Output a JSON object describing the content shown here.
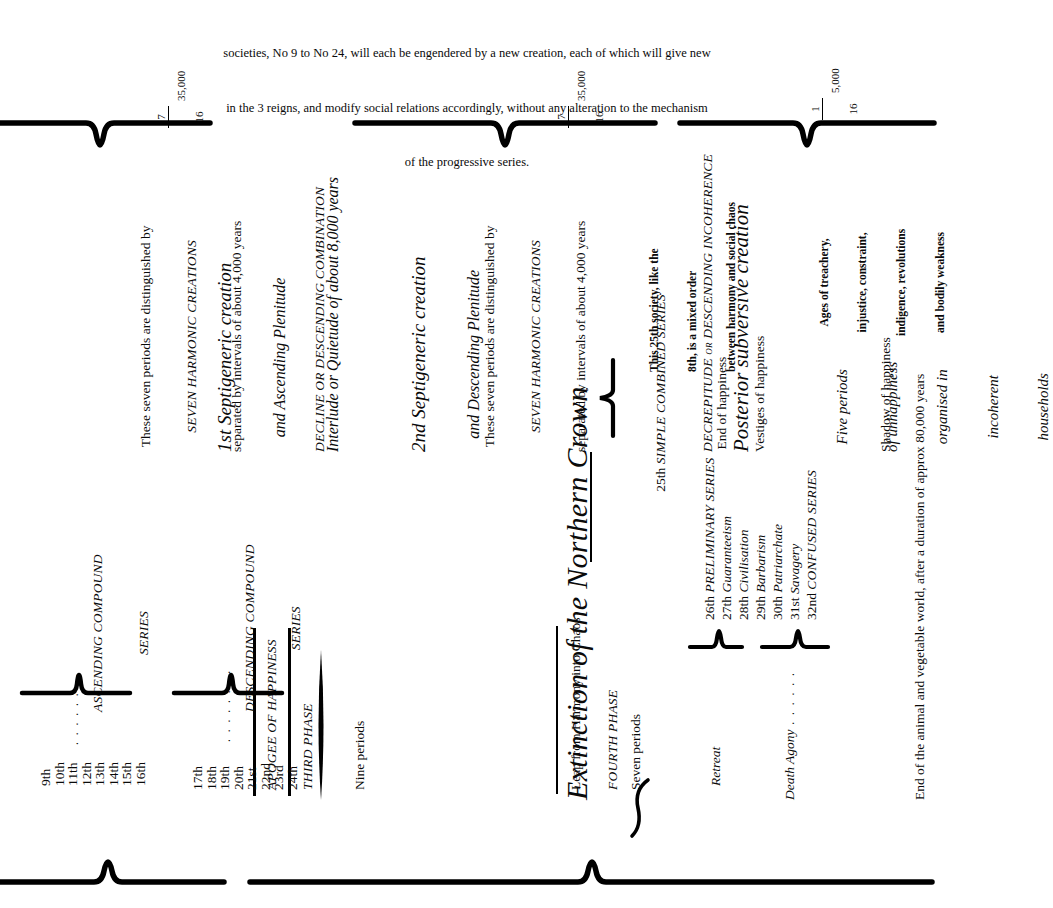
{
  "document": {
    "title": "Extinction of the Northern Crown",
    "orientation": "rotated-90-ccw",
    "ink_color": "#0a0a0a",
    "paper_color": "#ffffff"
  },
  "header": {
    "line1": "societies, No 9 to No 24, will each be engendered by a new creation, each of which will give new",
    "line2": "in the 3 reigns, and modify social relations accordingly, without any alteration to the mechanism",
    "line3": "of the progressive series."
  },
  "scale_markers": [
    {
      "numerator": "7",
      "denominator": "16",
      "value": "35,000"
    },
    {
      "numerator": "7",
      "denominator": "16",
      "value": "35,000"
    },
    {
      "numerator": "1",
      "denominator": "16",
      "value": "5,000"
    }
  ],
  "sections": {
    "first": {
      "note_line1": "These seven periods are distinguished by",
      "note_caps": "SEVEN HARMONIC CREATIONS",
      "note_line3": "separated by intervals of about 4,000 years",
      "heading_line1": "1st Septigeneric creation",
      "heading_line2": "and Ascending Plenitude",
      "series_caps_line1": "ASCENDING COMPOUND",
      "series_caps_line2": "SERIES",
      "periods": [
        "9th",
        "10th",
        "11th",
        "12th",
        "13th",
        "14th",
        "15th",
        "16th"
      ],
      "leader": ". . . . . . . ."
    },
    "interlude": {
      "heading": "Interlude or Quietude of about 8,000 years",
      "subheading": "DECLINE OR DESCENDING COMBINATION",
      "apogee_caps": "APOGEE OF HAPPINESS",
      "phase_caps": "THIRD PHASE",
      "phase_count": "Nine periods"
    },
    "second": {
      "heading_line1": "2nd Septigeneric creation",
      "heading_line2": "and Descending Plenitude",
      "note_line1": "These seven periods are distinguished by",
      "note_caps": "SEVEN HARMONIC CREATIONS",
      "note_line3": "separated by intervals of about 4,000 years",
      "series_caps_line1": "DESCENDING COMPOUND",
      "series_caps_line2": "SERIES",
      "periods": [
        "17th",
        "18th",
        "19th",
        "20th",
        "21st",
        "22nd",
        "23rd",
        "24th"
      ],
      "leader": ". . . . . . . ."
    },
    "crown": {
      "title": "Extinction of the Northern Crown",
      "series_25_number": "25th",
      "series_25_caps": "SIMPLE COMBINED SERIES",
      "series_25_sub": "End of happiness",
      "brace_note_line1": "This 25th society, like the",
      "brace_note_line2": "8th, is a mixed order",
      "brace_note_line3": "between harmony and social chaos",
      "leap": "Leap from Harmony into Chaos",
      "fourth_phase_caps": "FOURTH PHASE",
      "fourth_phase_count": "Seven periods"
    },
    "subversive": {
      "kicker_caps": "DECREPITUDE or DESCENDING INCOHERENCE",
      "title": "Posterior subversive creation",
      "vestiges": "Vestiges of happiness",
      "ages_line1": "Ages of treachery,",
      "ages_line2": "injustice, constraint,",
      "ages_line3": "indigence, revolutions",
      "ages_line4": "and bodily weakness",
      "five_line1": "Five periods",
      "five_line2": "of unhappiness",
      "five_line3": "organised in",
      "five_line4": "incoherent",
      "five_line5": "households",
      "shadow": "Shadow of happiness",
      "periods": [
        {
          "number": "26th",
          "label": "PRELIMINARY SERIES",
          "style": "smallcaps"
        },
        {
          "number": "27th",
          "label": "Guaranteeism",
          "style": "italic"
        },
        {
          "number": "28th",
          "label": "Civilisation",
          "style": "italic"
        },
        {
          "number": "29th",
          "label": "Barbarism",
          "style": "italic"
        },
        {
          "number": "30th",
          "label": "Patriarchate",
          "style": "italic"
        },
        {
          "number": "31st",
          "label": "Savagery",
          "style": "italic"
        },
        {
          "number": "32nd",
          "label": "CONFUSED SERIES",
          "style": "smallcaps"
        }
      ],
      "retreat": "Retreat",
      "death_agony": "Death Agony",
      "death_agony_leader": ". . . . . .",
      "final_line": "End of the animal and vegetable world, after a duration of approx 80,000 years"
    }
  }
}
